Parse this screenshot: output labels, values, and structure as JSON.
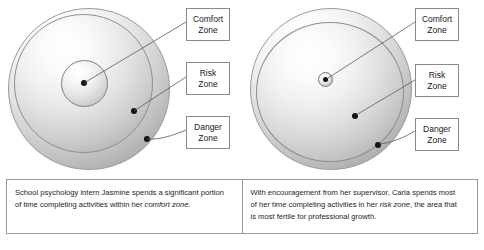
{
  "figure": {
    "type": "two-panel concentric zone diagram",
    "panels": [
      {
        "id": "left",
        "zones": [
          {
            "key": "comfort",
            "label_line1": "Comfort",
            "label_line2": "Zone"
          },
          {
            "key": "risk",
            "label_line1": "Risk",
            "label_line2": "Zone"
          },
          {
            "key": "danger",
            "label_line1": "Danger",
            "label_line2": "Zone"
          }
        ],
        "caption_lines": [
          {
            "text": "School psychology intern Jasmine spends a significant portion",
            "italic": ""
          },
          {
            "pre": "of time completing activities within her ",
            "italic": "comfort zone",
            "post": "."
          }
        ]
      },
      {
        "id": "right",
        "zones": [
          {
            "key": "comfort",
            "label_line1": "Comfort",
            "label_line2": "Zone"
          },
          {
            "key": "risk",
            "label_line1": "Risk",
            "label_line2": "Zone"
          },
          {
            "key": "danger",
            "label_line1": "Danger",
            "label_line2": "Zone"
          }
        ],
        "caption_lines": [
          {
            "text": "With encouragement from her supervisor, Carla spends most",
            "italic": ""
          },
          {
            "pre": "of her time completing activities in her ",
            "italic": "risk zone",
            "post": ", the area that"
          },
          {
            "text": "is most fertile for professional growth.",
            "italic": ""
          }
        ]
      }
    ],
    "colors": {
      "sphere_light": "#ffffff",
      "sphere_dark": "#8f8f8f",
      "outline": "#9b9b9b",
      "dot": "#121212",
      "box_border": "#8a8a8a",
      "table_border": "#9a9a9a",
      "text": "#1e1e1e",
      "background": "#ffffff"
    },
    "labels": {
      "comfort_l1": "Comfort",
      "comfort_l2": "Zone",
      "risk_l1": "Risk",
      "risk_l2": "Zone",
      "danger_l1": "Danger",
      "danger_l2": "Zone"
    },
    "left_caption": {
      "line1": "School psychology intern Jasmine spends a significant portion",
      "line2_pre": "of time completing activities within her ",
      "line2_em": "comfort zone",
      "line2_post": "."
    },
    "right_caption": {
      "line1": "With encouragement from her supervisor, Carla spends most",
      "line2_pre": "of her time completing activities in her ",
      "line2_em": "risk zone",
      "line2_post": ", the area that",
      "line3": "is most fertile for professional growth."
    }
  }
}
